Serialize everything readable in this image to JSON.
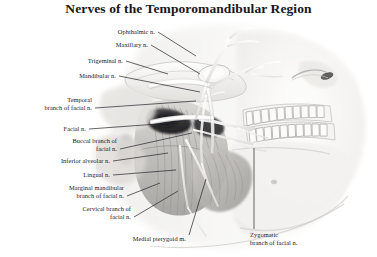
{
  "figure": {
    "title": "Nerves of the Temporomandibular Region",
    "style": "grayscale medical illustration",
    "colors": {
      "background": "#ffffff",
      "text": "#1b1a1e",
      "leader_line": "#24232a",
      "anatomy_light": "#f2f1ef",
      "anatomy_mid": "#c9c7c4",
      "anatomy_dark": "#4a4a4c",
      "anatomy_shadow": "#1d1d20",
      "nerve": "#fbfbfa"
    }
  },
  "labels": [
    {
      "id": "ophthalmic-n",
      "text": "Ophthalmic n.",
      "lines": [
        "Ophthalmic n."
      ],
      "align": "right",
      "x": 155,
      "y": 28,
      "leader": [
        [
          158,
          32
        ],
        [
          196,
          56
        ]
      ]
    },
    {
      "id": "maxillary-n",
      "text": "Maxillary n.",
      "lines": [
        "Maxillary n."
      ],
      "align": "right",
      "x": 148,
      "y": 41,
      "leader": [
        [
          151,
          45
        ],
        [
          200,
          74
        ]
      ]
    },
    {
      "id": "trigeminal-n",
      "text": "Trigeminal n.",
      "lines": [
        "Trigeminal n."
      ],
      "align": "right",
      "x": 123,
      "y": 57,
      "leader": [
        [
          126,
          61
        ],
        [
          168,
          74
        ]
      ]
    },
    {
      "id": "mandibular-n",
      "text": "Mandibular n.",
      "lines": [
        "Mandibular n."
      ],
      "align": "right",
      "x": 116,
      "y": 72,
      "leader": [
        [
          119,
          76
        ],
        [
          200,
          92
        ]
      ]
    },
    {
      "id": "temporal-branch",
      "text": "Temporal branch of facial n.",
      "lines": [
        "Temporal",
        "branch of facial n."
      ],
      "align": "right",
      "x": 92,
      "y": 96,
      "leader": [
        [
          95,
          108
        ],
        [
          196,
          101
        ]
      ]
    },
    {
      "id": "facial-n",
      "text": "Facial n.",
      "lines": [
        "Facial n."
      ],
      "align": "right",
      "x": 86,
      "y": 125,
      "leader": [
        [
          89,
          129
        ],
        [
          158,
          124
        ]
      ]
    },
    {
      "id": "buccal-branch",
      "text": "Buccal branch of facial n.",
      "lines": [
        "Buccal branch of",
        "facial n."
      ],
      "align": "right",
      "x": 117,
      "y": 137,
      "leader": [
        [
          120,
          149
        ],
        [
          192,
          133
        ]
      ]
    },
    {
      "id": "inferior-alveolar-n",
      "text": "Inferior alveolar n.",
      "lines": [
        "Inferior alveolar n."
      ],
      "align": "right",
      "x": 110,
      "y": 157,
      "leader": [
        [
          113,
          161
        ],
        [
          168,
          153
        ]
      ]
    },
    {
      "id": "lingual-n",
      "text": "Lingual n.",
      "lines": [
        "Lingual n."
      ],
      "align": "right",
      "x": 110,
      "y": 171,
      "leader": [
        [
          113,
          175
        ],
        [
          176,
          170
        ]
      ]
    },
    {
      "id": "marginal-mandibular",
      "text": "Marginal mandibular branch of facial n.",
      "lines": [
        "Marginal mandibular",
        "branch of facial n."
      ],
      "align": "right",
      "x": 124,
      "y": 184,
      "leader": [
        [
          127,
          196
        ],
        [
          160,
          183
        ]
      ]
    },
    {
      "id": "cervical-branch",
      "text": "Cervical branch of facial n.",
      "lines": [
        "Cervical branch of",
        "facial n."
      ],
      "align": "right",
      "x": 131,
      "y": 205,
      "leader": [
        [
          134,
          217
        ],
        [
          178,
          191
        ]
      ]
    },
    {
      "id": "medial-pterygoid-m",
      "text": "Medial pterygoid m.",
      "lines": [
        "Medial pterygoid m."
      ],
      "align": "right",
      "x": 186,
      "y": 235,
      "leader": [
        [
          189,
          235
        ],
        [
          206,
          179
        ]
      ]
    },
    {
      "id": "zygomatic-branch",
      "text": "Zygomatic branch of facial n.",
      "lines": [
        "Zygomatic",
        "branch of facial n."
      ],
      "align": "left",
      "x": 250,
      "y": 231,
      "leader": [
        [
          254,
          229
        ],
        [
          254,
          148
        ]
      ]
    }
  ]
}
